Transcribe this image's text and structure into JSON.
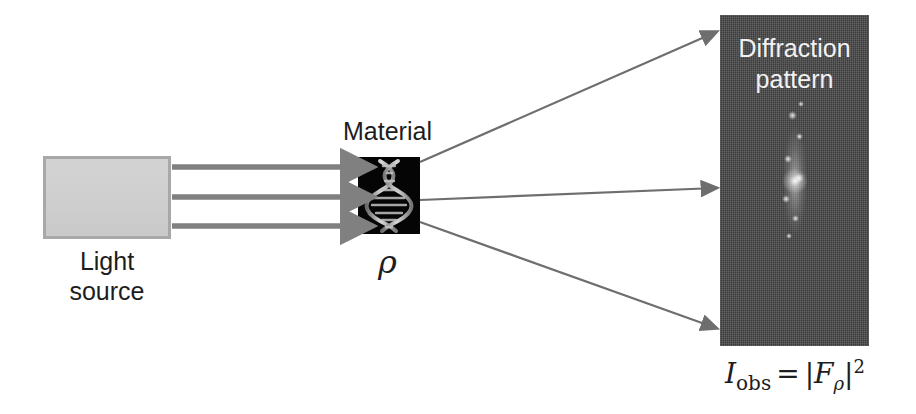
{
  "diagram": {
    "background_color": "#ffffff"
  },
  "light_source": {
    "label": "Light\nsource",
    "fill_color": "#d0d0d0",
    "border_color": "#a8a8a8"
  },
  "beams": {
    "count": 3,
    "color": "#808080",
    "description": "incident light beam arrows"
  },
  "material": {
    "label": "Material",
    "symbol": "ρ",
    "fill_color": "#050505",
    "content": "dna-double-helix"
  },
  "scattered": {
    "count": 3,
    "color": "#6e6e6e",
    "description": "diffracted ray arrows"
  },
  "detector": {
    "title": "Diffraction\npattern",
    "panel_color": "#4a4a4a",
    "text_color": "#f2f2f2",
    "pattern": "vertical speckle streak"
  },
  "formula": {
    "symbol_I": "I",
    "subscript_obs": "obs",
    "equals": "=",
    "bar_open": "|",
    "symbol_F": "F",
    "subscript_rho": "ρ",
    "bar_close": "|",
    "exponent": "2",
    "plain": "I_obs = |F_ρ|^2"
  }
}
